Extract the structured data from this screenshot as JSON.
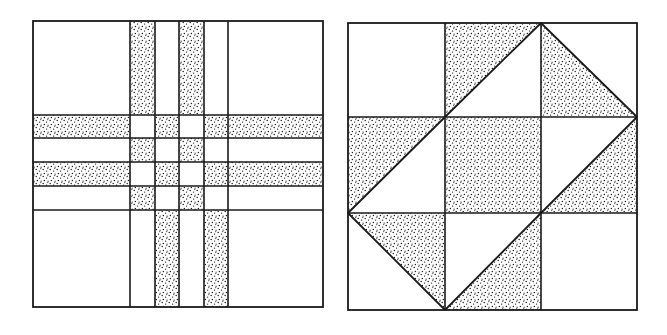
{
  "colors": {
    "ink": "#1a1a1a",
    "paper": "#ffffff",
    "stipple": "#222222"
  },
  "figures": [
    {
      "name": "plaid-quilt-block",
      "x_lines": [
        33,
        130,
        155,
        179,
        204,
        228,
        323
      ],
      "y_lines": [
        21,
        115,
        138,
        162,
        186,
        210,
        307
      ],
      "shaded_cells": [
        [
          0,
          1
        ],
        [
          0,
          3
        ],
        [
          1,
          0
        ],
        [
          1,
          2
        ],
        [
          1,
          4
        ],
        [
          1,
          5
        ],
        [
          2,
          1
        ],
        [
          2,
          3
        ],
        [
          2,
          6
        ],
        [
          3,
          0
        ],
        [
          3,
          2
        ],
        [
          3,
          4
        ],
        [
          3,
          5
        ],
        [
          4,
          1
        ],
        [
          4,
          3
        ],
        [
          4,
          6
        ],
        [
          5,
          2
        ],
        [
          5,
          4
        ]
      ]
    },
    {
      "name": "triangle-quilt-block",
      "x_lines": [
        348,
        445,
        541,
        637
      ],
      "y_lines": [
        23,
        117,
        213,
        310
      ],
      "cells": [
        [
          "blank",
          "tri-ul-diag-up",
          "tri-ll-diag-down"
        ],
        [
          "tri-ul-diag-up",
          "full",
          "tri-lr-diag-up"
        ],
        [
          "tri-ur-diag-down",
          "tri-lr-diag-up",
          "blank"
        ]
      ]
    }
  ]
}
